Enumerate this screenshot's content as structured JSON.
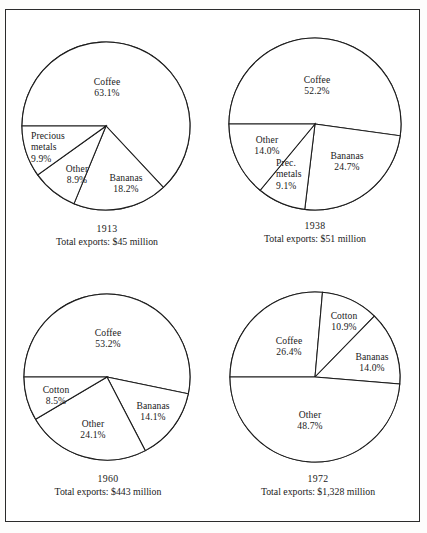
{
  "figure": {
    "background_color": "#ffffff",
    "frame_color": "#2b2b2b",
    "line_color": "#1c1c1c"
  },
  "chart_data": [
    {
      "type": "pie",
      "title": "1913",
      "subtitle": "Total exports:  $45 million",
      "year": "1913",
      "total_exports": "$45 million",
      "categories": [
        "Coffee",
        "Bananas",
        "Other",
        "Precious metals"
      ],
      "values": [
        63.1,
        18.2,
        8.9,
        9.9
      ],
      "labels": [
        "63.1%",
        "18.2%",
        "8.9%",
        "9.9%"
      ],
      "start_angle_deg": 180,
      "direction": "clockwise",
      "legend": "none",
      "grid": false
    },
    {
      "type": "pie",
      "title": "1938",
      "subtitle": "Total exports:  $51 million",
      "year": "1938",
      "total_exports": "$51 million",
      "categories": [
        "Coffee",
        "Bananas",
        "Prec. metals",
        "Other"
      ],
      "values": [
        52.2,
        24.7,
        9.1,
        14.0
      ],
      "labels": [
        "52.2%",
        "24.7%",
        "9.1%",
        "14.0%"
      ],
      "start_angle_deg": 180,
      "direction": "clockwise",
      "legend": "none",
      "grid": false
    },
    {
      "type": "pie",
      "title": "1960",
      "subtitle": "Total exports:  $443 million",
      "year": "1960",
      "total_exports": "$443 million",
      "categories": [
        "Coffee",
        "Bananas",
        "Other",
        "Cotton"
      ],
      "values": [
        53.2,
        14.1,
        24.1,
        8.5
      ],
      "labels": [
        "53.2%",
        "14.1%",
        "24.1%",
        "8.5%"
      ],
      "start_angle_deg": 180,
      "direction": "clockwise",
      "legend": "none",
      "grid": false
    },
    {
      "type": "pie",
      "title": "1972",
      "subtitle": "Total exports:  $1,328 million",
      "year": "1972",
      "total_exports": "$1,328 million",
      "categories": [
        "Coffee",
        "Cotton",
        "Bananas",
        "Other"
      ],
      "values": [
        26.4,
        10.9,
        14.0,
        48.7
      ],
      "labels": [
        "26.4%",
        "10.9%",
        "14.0%",
        "48.7%"
      ],
      "start_angle_deg": 180,
      "direction": "clockwise",
      "legend": "none",
      "grid": false
    }
  ],
  "charts": [
    {
      "id": "chart-1913",
      "year_label": "1913",
      "total_label": "Total exports:  $45 million",
      "slices": [
        {
          "name": "Coffee",
          "pct": "63.1%"
        },
        {
          "name": "Bananas",
          "pct": "18.2%"
        },
        {
          "name": "Other",
          "pct": "8.9%"
        },
        {
          "name": "Precious metals",
          "pct": "9.9%"
        }
      ],
      "slice_label_lines": {
        "precious_metals_line1": "Precious",
        "precious_metals_line2": "metals"
      }
    },
    {
      "id": "chart-1938",
      "year_label": "1938",
      "total_label": "Total exports:  $51 million",
      "slices": [
        {
          "name": "Coffee",
          "pct": "52.2%"
        },
        {
          "name": "Bananas",
          "pct": "24.7%"
        },
        {
          "name": "Prec. metals",
          "pct": "9.1%"
        },
        {
          "name": "Other",
          "pct": "14.0%"
        }
      ],
      "slice_label_lines": {
        "prec_metals_line1": "Prec.",
        "prec_metals_line2": "metals"
      }
    },
    {
      "id": "chart-1960",
      "year_label": "1960",
      "total_label": "Total exports:  $443 million",
      "slices": [
        {
          "name": "Coffee",
          "pct": "53.2%"
        },
        {
          "name": "Bananas",
          "pct": "14.1%"
        },
        {
          "name": "Other",
          "pct": "24.1%"
        },
        {
          "name": "Cotton",
          "pct": "8.5%"
        }
      ]
    },
    {
      "id": "chart-1972",
      "year_label": "1972",
      "total_label": "Total exports:  $1,328 million",
      "slices": [
        {
          "name": "Coffee",
          "pct": "26.4%"
        },
        {
          "name": "Cotton",
          "pct": "10.9%"
        },
        {
          "name": "Bananas",
          "pct": "14.0%"
        },
        {
          "name": "Other",
          "pct": "48.7%"
        }
      ]
    }
  ]
}
